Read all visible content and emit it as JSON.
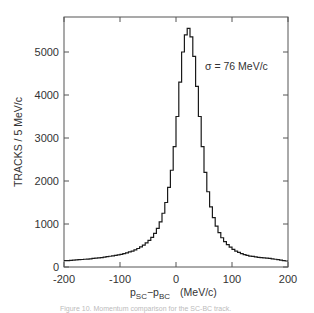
{
  "chart_data": {
    "type": "bar",
    "style": "step-histogram",
    "title": "",
    "xlabel": "p_SC − p_BC  (MeV/c)",
    "xlabel_parts": {
      "p1": "p",
      "s1": "SC",
      "minus": "−",
      "p2": "p",
      "s2": "BC",
      "units": "(MeV/c)"
    },
    "ylabel": "TRACKS / 5 MeV/c",
    "xlim": [
      -200,
      200
    ],
    "ylim": [
      0,
      5800
    ],
    "xticks": [
      -200,
      -100,
      0,
      100,
      200
    ],
    "xtick_labels": [
      "-200",
      "-100",
      "0",
      "100",
      "200"
    ],
    "yticks": [
      0,
      1000,
      2000,
      3000,
      4000,
      5000
    ],
    "ytick_labels": [
      "0",
      "1000",
      "2000",
      "3000",
      "4000",
      "5000"
    ],
    "grid": false,
    "annotation": "σ = 76 MeV/c",
    "bin_width": 5,
    "bin_edges_start": -200,
    "values": [
      150,
      150,
      155,
      160,
      165,
      170,
      175,
      180,
      185,
      190,
      200,
      205,
      210,
      220,
      230,
      240,
      250,
      260,
      270,
      280,
      295,
      310,
      330,
      350,
      370,
      400,
      430,
      470,
      510,
      560,
      620,
      690,
      780,
      900,
      1050,
      1250,
      1500,
      1850,
      2250,
      2800,
      3500,
      4300,
      5000,
      5400,
      5550,
      5350,
      4900,
      4200,
      3500,
      2800,
      2200,
      1750,
      1400,
      1150,
      950,
      800,
      680,
      590,
      520,
      460,
      410,
      370,
      340,
      310,
      290,
      270,
      255,
      245,
      235,
      225,
      220,
      210,
      205,
      200,
      190,
      180,
      170,
      160,
      150,
      140
    ],
    "caption": "Figure 10. Momentum comparison for the SC-BC track."
  }
}
